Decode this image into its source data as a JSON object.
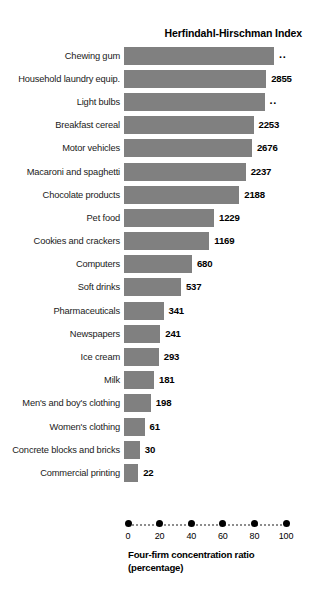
{
  "chart_data": {
    "type": "bar",
    "title": "Herfindahl-Hirschman Index",
    "xlabel_line1": "Four-firm concentration ratio",
    "xlabel_line2": "(percentage)",
    "ylabel": "",
    "orientation": "horizontal",
    "xlim": [
      0,
      100
    ],
    "xticks": [
      0,
      20,
      40,
      60,
      80,
      100
    ],
    "xtick_labels": [
      "0",
      "20",
      "40",
      "60",
      "80",
      "100"
    ],
    "grid": false,
    "legend": "none",
    "bar_color": "#808080",
    "value_label_note": "Values at bar ends are the Herfindahl-Hirschman Index; bar length is the four-firm concentration ratio (percentage). '..' means not available.",
    "categories": [
      "Chewing gum",
      "Household laundry equip.",
      "Light bulbs",
      "Breakfast cereal",
      "Motor vehicles",
      "Macaroni and spaghetti",
      "Chocolate products",
      "Pet food",
      "Cookies and crackers",
      "Computers",
      "Soft drinks",
      "Pharmaceuticals",
      "Newspapers",
      "Ice cream",
      "Milk",
      "Men's and boy's clothing",
      "Women's clothing",
      "Concrete blocks and bricks",
      "Commercial printing"
    ],
    "values": [
      95,
      90,
      89,
      82,
      81,
      77,
      73,
      57,
      54,
      43,
      36,
      25,
      23,
      22,
      19,
      17,
      13,
      10,
      9
    ],
    "hhi_labels": [
      "..",
      "2855",
      "..",
      "2253",
      "2676",
      "2237",
      "2188",
      "1229",
      "1169",
      "680",
      "537",
      "341",
      "241",
      "293",
      "181",
      "198",
      "61",
      "30",
      "22"
    ],
    "series": [
      {
        "name": "Four-firm concentration ratio (percentage)",
        "values": [
          95,
          90,
          89,
          82,
          81,
          77,
          73,
          57,
          54,
          43,
          36,
          25,
          23,
          22,
          19,
          17,
          13,
          10,
          9
        ]
      },
      {
        "name": "Herfindahl-Hirschman Index",
        "values": [
          null,
          2855,
          null,
          2253,
          2676,
          2237,
          2188,
          1229,
          1169,
          680,
          537,
          341,
          241,
          293,
          181,
          198,
          61,
          30,
          22
        ]
      }
    ]
  }
}
